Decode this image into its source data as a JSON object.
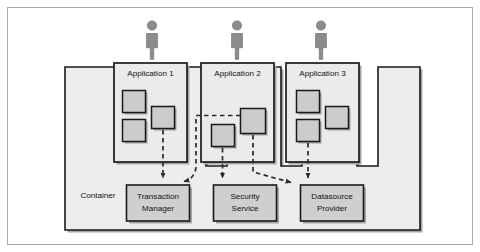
{
  "figure": {
    "kind": "architecture-diagram",
    "title": "",
    "background_color": "#ffffff",
    "outer_border_color": "#9a9a9a",
    "line_color": "#1a1a1a",
    "fill_light": "#eeeeee",
    "fill_component": "#cfcfcf",
    "actor_color": "#8a8a8a",
    "shadow_color": "#9d9d9d",
    "dashed_color": "#2b2b2b"
  },
  "container": {
    "label": "Container"
  },
  "actors": [
    {
      "name": "actor-app-1"
    },
    {
      "name": "actor-app-2"
    },
    {
      "name": "actor-app-3"
    }
  ],
  "applications": [
    {
      "label": "Application 1",
      "components": [
        {
          "name": "component-a"
        },
        {
          "name": "component-b"
        },
        {
          "name": "component-c"
        }
      ]
    },
    {
      "label": "Application 2",
      "components": [
        {
          "name": "component-a"
        },
        {
          "name": "component-b"
        }
      ]
    },
    {
      "label": "Application 3",
      "components": [
        {
          "name": "component-a"
        },
        {
          "name": "component-b"
        },
        {
          "name": "component-c"
        }
      ]
    }
  ],
  "services": [
    {
      "line1": "Transaction",
      "line2": "Manager"
    },
    {
      "line1": "Security",
      "line2": "Service"
    },
    {
      "line1": "Datasource",
      "line2": "Provider"
    }
  ],
  "connections": [
    {
      "from": "application-1",
      "to": "transaction-manager",
      "style": "dashed"
    },
    {
      "from": "application-2",
      "to": "transaction-manager",
      "style": "dashed"
    },
    {
      "from": "application-2",
      "to": "security-service",
      "style": "dashed"
    },
    {
      "from": "application-2",
      "to": "datasource-provider",
      "style": "dashed"
    },
    {
      "from": "application-3",
      "to": "datasource-provider",
      "style": "dashed"
    }
  ]
}
